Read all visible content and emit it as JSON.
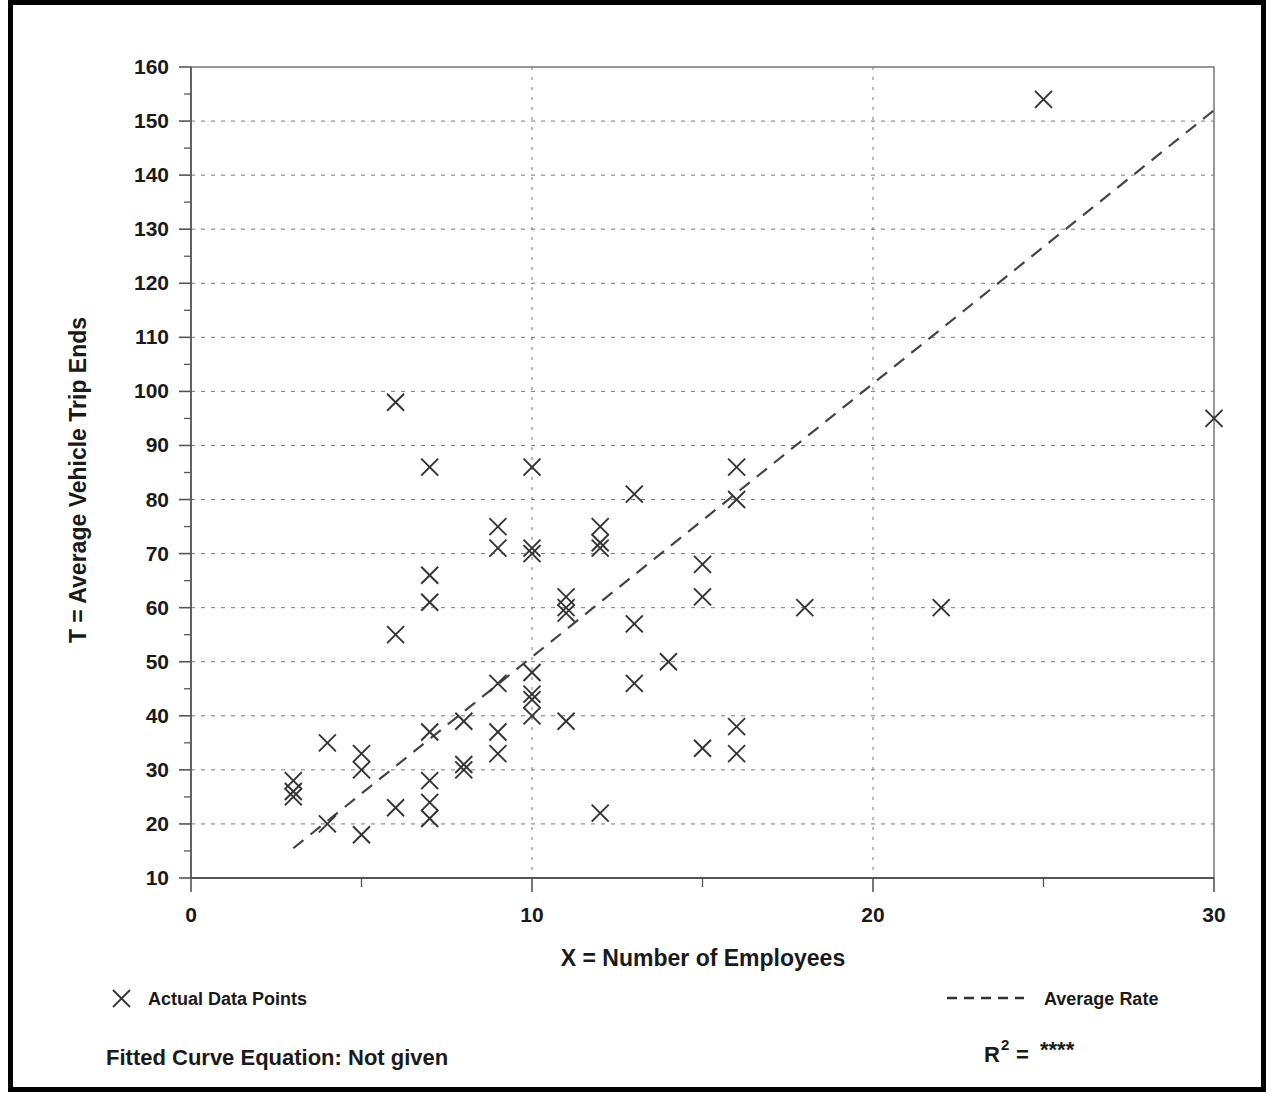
{
  "chart_data": {
    "type": "scatter",
    "title": "",
    "xlabel": "X = Number of Employees",
    "ylabel": "T = Average Vehicle Trip Ends",
    "xlim": [
      0,
      30
    ],
    "ylim": [
      10,
      160
    ],
    "xticks": [
      0,
      10,
      20,
      30
    ],
    "xtick_labels": [
      "0",
      "10",
      "20",
      "30"
    ],
    "xminor_step": 5,
    "yticks": [
      10,
      20,
      30,
      40,
      50,
      60,
      70,
      80,
      90,
      100,
      110,
      120,
      130,
      140,
      150,
      160
    ],
    "ytick_labels": [
      "10",
      "20",
      "30",
      "40",
      "50",
      "60",
      "70",
      "80",
      "90",
      "100",
      "110",
      "120",
      "130",
      "140",
      "150",
      "160"
    ],
    "yminor_step": 5,
    "grid": true,
    "grid_style": "dotted",
    "legend_position": "below-plot",
    "marker": "x",
    "series": [
      {
        "name": "Actual Data Points",
        "type": "scatter",
        "marker": "x",
        "color": "#333333",
        "points": [
          [
            3,
            28
          ],
          [
            3,
            26
          ],
          [
            3,
            25
          ],
          [
            4,
            35
          ],
          [
            4,
            20
          ],
          [
            5,
            33
          ],
          [
            5,
            30
          ],
          [
            5,
            18
          ],
          [
            6,
            98
          ],
          [
            6,
            55
          ],
          [
            6,
            23
          ],
          [
            7,
            86
          ],
          [
            7,
            66
          ],
          [
            7,
            61
          ],
          [
            7,
            37
          ],
          [
            7,
            28
          ],
          [
            7,
            24
          ],
          [
            7,
            21
          ],
          [
            8,
            39
          ],
          [
            8,
            31
          ],
          [
            8,
            30
          ],
          [
            9,
            75
          ],
          [
            9,
            71
          ],
          [
            9,
            46
          ],
          [
            9,
            37
          ],
          [
            9,
            33
          ],
          [
            10,
            86
          ],
          [
            10,
            71
          ],
          [
            10,
            70
          ],
          [
            10,
            48
          ],
          [
            10,
            44
          ],
          [
            10,
            43
          ],
          [
            10,
            40
          ],
          [
            11,
            62
          ],
          [
            11,
            60
          ],
          [
            11,
            59
          ],
          [
            11,
            39
          ],
          [
            12,
            75
          ],
          [
            12,
            72
          ],
          [
            12,
            71
          ],
          [
            12,
            22
          ],
          [
            13,
            81
          ],
          [
            13,
            57
          ],
          [
            13,
            46
          ],
          [
            14,
            50
          ],
          [
            15,
            68
          ],
          [
            15,
            62
          ],
          [
            15,
            34
          ],
          [
            16,
            86
          ],
          [
            16,
            80
          ],
          [
            16,
            38
          ],
          [
            16,
            33
          ],
          [
            18,
            60
          ],
          [
            22,
            60
          ],
          [
            25,
            154
          ],
          [
            30,
            95
          ]
        ]
      },
      {
        "name": "Average Rate",
        "type": "line",
        "style": "dashed",
        "color": "#444444",
        "x_start": 3.0,
        "y_start": 15.5,
        "x_end": 30.0,
        "y_end": 152.0
      }
    ]
  },
  "legend": {
    "entries": [
      {
        "label": "Actual Data Points",
        "marker": "x-marker-icon"
      },
      {
        "label": "Average Rate",
        "marker": "dashed-line-icon"
      }
    ]
  },
  "footer": {
    "fitted_curve_label": "Fitted Curve Equation:  Not given",
    "r_squared_prefix": "R",
    "r_squared_exponent": "2",
    "r_squared_equals": "=",
    "r_squared_value": "****"
  },
  "colors": {
    "frame": "#000000",
    "axis": "#555555",
    "grid": "#777777",
    "marker": "#333333",
    "trend": "#444444",
    "text": "#1a1a1a",
    "background": "#ffffff"
  }
}
